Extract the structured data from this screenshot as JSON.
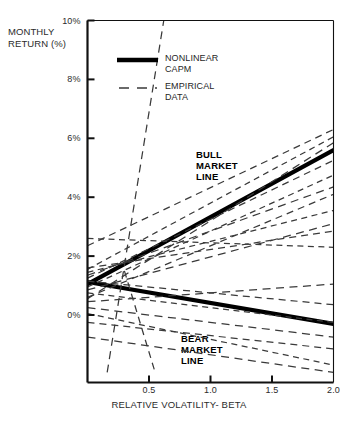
{
  "chart_data": {
    "type": "line",
    "title": "",
    "xlabel": "RELATIVE VOLATILITY- BETA",
    "ylabel": "MONTHLY\nRETURN (%)",
    "xlim": [
      0.0,
      2.0
    ],
    "ylim": [
      -2.0,
      10.0
    ],
    "grid": false,
    "xticks": [
      0.5,
      1.0,
      1.5,
      2.0
    ],
    "xtick_labels": [
      "0.5",
      "1.0",
      "1.5",
      "2.0"
    ],
    "yticks": [
      0,
      2,
      4,
      6,
      8,
      10
    ],
    "ytick_labels": [
      "0%",
      "2%",
      "4%",
      "6%",
      "8%",
      "10%"
    ],
    "legend": {
      "position": "top-left-inside",
      "entries": [
        {
          "label": "NONLINEAR\nCAPM",
          "style": "solid-thick",
          "color": "#000000"
        },
        {
          "label": "EMPIRICAL\nDATA",
          "style": "dashed",
          "color": "#3a3a3a"
        }
      ]
    },
    "annotations": [
      {
        "text": "BULL\nMARKET\nLINE",
        "x": 1.05,
        "y": 4.95
      },
      {
        "text": "BEAR\nMARKET\nLINE",
        "x": 0.88,
        "y": -0.35
      }
    ],
    "series": [
      {
        "name": "Bull market line",
        "style": "solid-thick",
        "color": "#000000",
        "points": [
          [
            0.0,
            1.05
          ],
          [
            2.0,
            5.6
          ]
        ]
      },
      {
        "name": "Bear market line",
        "style": "solid-thick",
        "color": "#000000",
        "points": [
          [
            0.0,
            1.12
          ],
          [
            2.0,
            -0.3
          ]
        ]
      },
      {
        "name": "Empirical data 1",
        "style": "dashed",
        "points": [
          [
            0.16,
            -1.95
          ],
          [
            0.62,
            10.0
          ]
        ]
      },
      {
        "name": "Empirical data 2",
        "style": "dashed",
        "points": [
          [
            0.0,
            2.35
          ],
          [
            2.0,
            6.3
          ]
        ]
      },
      {
        "name": "Empirical data 3",
        "style": "dashed",
        "points": [
          [
            0.0,
            1.55
          ],
          [
            2.0,
            6.05
          ]
        ]
      },
      {
        "name": "Empirical data 4",
        "style": "dashed",
        "points": [
          [
            0.0,
            0.55
          ],
          [
            2.0,
            5.85
          ]
        ]
      },
      {
        "name": "Empirical data 5",
        "style": "dashed",
        "points": [
          [
            0.0,
            1.25
          ],
          [
            2.0,
            5.25
          ]
        ]
      },
      {
        "name": "Empirical data 6",
        "style": "dashed",
        "points": [
          [
            0.0,
            0.95
          ],
          [
            2.0,
            4.75
          ]
        ]
      },
      {
        "name": "Empirical data 7",
        "style": "dashed",
        "points": [
          [
            0.0,
            1.35
          ],
          [
            2.0,
            4.35
          ]
        ]
      },
      {
        "name": "Empirical data 8",
        "style": "dashed",
        "points": [
          [
            0.0,
            0.6
          ],
          [
            2.0,
            4.1
          ]
        ]
      },
      {
        "name": "Empirical data 9",
        "style": "dashed",
        "points": [
          [
            0.0,
            1.45
          ],
          [
            2.0,
            3.55
          ]
        ]
      },
      {
        "name": "Empirical data 10",
        "style": "dashed",
        "points": [
          [
            0.0,
            0.85
          ],
          [
            2.0,
            3.1
          ]
        ]
      },
      {
        "name": "Empirical data 11",
        "style": "dashed",
        "points": [
          [
            0.0,
            1.6
          ],
          [
            2.0,
            2.85
          ]
        ]
      },
      {
        "name": "Empirical data 12",
        "style": "dashed",
        "points": [
          [
            0.0,
            2.6
          ],
          [
            2.0,
            2.3
          ]
        ]
      },
      {
        "name": "Empirical data 13",
        "style": "dashed",
        "points": [
          [
            0.0,
            0.45
          ],
          [
            2.0,
            1.05
          ]
        ]
      },
      {
        "name": "Empirical data 14",
        "style": "dashed",
        "points": [
          [
            0.0,
            1.15
          ],
          [
            2.0,
            0.35
          ]
        ]
      },
      {
        "name": "Empirical data 15",
        "style": "dashed",
        "points": [
          [
            0.0,
            0.75
          ],
          [
            2.0,
            -0.25
          ]
        ]
      },
      {
        "name": "Empirical data 16",
        "style": "dashed",
        "points": [
          [
            0.0,
            0.25
          ],
          [
            2.0,
            -0.75
          ]
        ]
      },
      {
        "name": "Empirical data 17",
        "style": "dashed",
        "points": [
          [
            0.0,
            -0.25
          ],
          [
            2.0,
            -1.15
          ]
        ]
      },
      {
        "name": "Empirical data 18",
        "style": "dashed",
        "points": [
          [
            0.0,
            0.05
          ],
          [
            2.0,
            -1.7
          ]
        ]
      },
      {
        "name": "Empirical data 19",
        "style": "dashed",
        "points": [
          [
            0.0,
            -0.75
          ],
          [
            2.0,
            -1.95
          ]
        ]
      },
      {
        "name": "Empirical data 20",
        "style": "dashed",
        "points": [
          [
            0.3,
            1.5
          ],
          [
            0.55,
            -1.95
          ]
        ]
      }
    ]
  },
  "caption": ""
}
